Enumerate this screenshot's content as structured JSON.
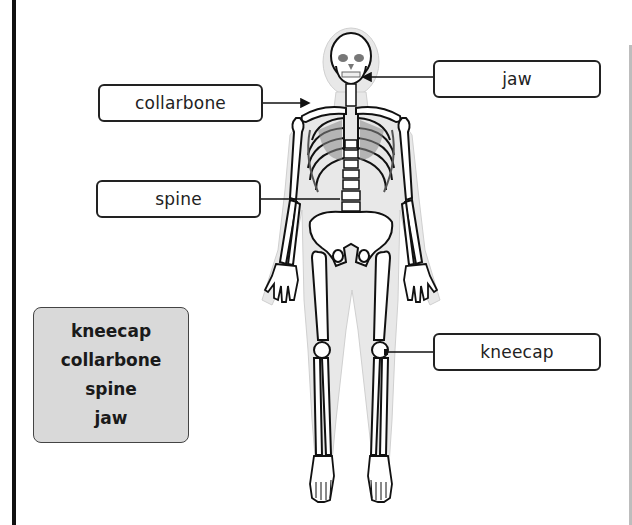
{
  "diagram": {
    "labels": [
      {
        "id": "collarbone",
        "text": "collarbone",
        "side": "left"
      },
      {
        "id": "spine",
        "text": "spine",
        "side": "left"
      },
      {
        "id": "jaw",
        "text": "jaw",
        "side": "right"
      },
      {
        "id": "kneecap",
        "text": "kneecap",
        "side": "right"
      }
    ],
    "word_bank": {
      "words": [
        "kneecap",
        "collarbone",
        "spine",
        "jaw"
      ]
    },
    "colors": {
      "border": "#111111",
      "word_bank_bg": "#d9d9d9",
      "body_outline": "#e6e6e6",
      "bone_fill": "#ffffff",
      "bone_stroke": "#111111",
      "shading": "#8a8a8a"
    }
  }
}
